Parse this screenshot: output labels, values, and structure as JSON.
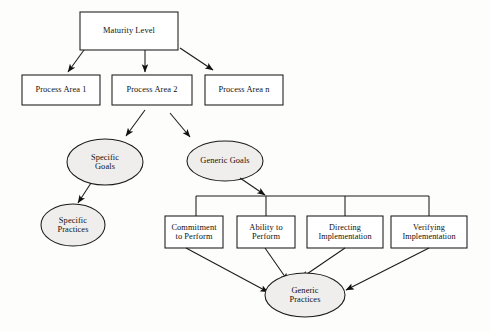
{
  "diagram": {
    "style": {
      "stroke": "#1a1a1a",
      "box_fill": "#ffffff",
      "ellipse_fill": "#f0eeec",
      "background": "#fdfdfb",
      "text_color": "#111111"
    },
    "nodes": [
      {
        "id": "maturity-level",
        "shape": "rect",
        "label": "Maturity Level",
        "x": 80,
        "y": 12,
        "w": 98,
        "h": 38
      },
      {
        "id": "process-area-1",
        "shape": "rect",
        "label": "Process Area 1",
        "x": 22,
        "y": 75,
        "w": 78,
        "h": 30
      },
      {
        "id": "process-area-2",
        "shape": "rect",
        "label": "Process Area 2",
        "x": 112,
        "y": 75,
        "w": 80,
        "h": 30
      },
      {
        "id": "process-area-n",
        "shape": "rect",
        "label": "Process Area n",
        "x": 205,
        "y": 75,
        "w": 78,
        "h": 30
      },
      {
        "id": "specific-goals",
        "shape": "ellipse",
        "label": "Specific\nGoals",
        "cx": 105,
        "cy": 162,
        "rx": 38,
        "ry": 23
      },
      {
        "id": "generic-goals",
        "shape": "ellipse",
        "label": "Generic Goals",
        "cx": 225,
        "cy": 161,
        "rx": 38,
        "ry": 20
      },
      {
        "id": "specific-practices",
        "shape": "ellipse",
        "label": "Specific\nPractices",
        "cx": 73,
        "cy": 225,
        "rx": 32,
        "ry": 21
      },
      {
        "id": "commitment-to-perform",
        "shape": "rect",
        "label": "Commitment\nto Perform",
        "x": 165,
        "y": 216,
        "w": 58,
        "h": 32
      },
      {
        "id": "ability-to-perform",
        "shape": "rect",
        "label": "Ability  to\nPerform",
        "x": 237,
        "y": 216,
        "w": 58,
        "h": 32
      },
      {
        "id": "directing-implementation",
        "shape": "rect",
        "label": "Directing\nImplementation",
        "x": 307,
        "y": 216,
        "w": 76,
        "h": 32
      },
      {
        "id": "verifying-implementation",
        "shape": "rect",
        "label": "Verifying\nImplementation",
        "x": 391,
        "y": 216,
        "w": 76,
        "h": 32
      }
    ],
    "edges": [
      {
        "id": "edge-ml-pa1",
        "from": "maturity-level",
        "to": "process-area-1",
        "kind": "arrow"
      },
      {
        "id": "edge-ml-pa2",
        "from": "maturity-level",
        "to": "process-area-2",
        "kind": "arrow"
      },
      {
        "id": "edge-ml-pan",
        "from": "maturity-level",
        "to": "process-area-n",
        "kind": "arrow"
      },
      {
        "id": "edge-pa2-sg",
        "from": "process-area-2",
        "to": "specific-goals",
        "kind": "arrow"
      },
      {
        "id": "edge-pa2-gg",
        "from": "process-area-2",
        "to": "generic-goals",
        "kind": "arrow"
      },
      {
        "id": "edge-sg-sp",
        "from": "specific-goals",
        "to": "specific-practices",
        "kind": "arrow"
      },
      {
        "id": "edge-gg-bus",
        "from": "generic-goals",
        "to": "common-features-bus",
        "kind": "arrow"
      },
      {
        "id": "edge-bus-commitment",
        "from": "common-features-bus",
        "to": "commitment-to-perform",
        "kind": "line"
      },
      {
        "id": "edge-bus-ability",
        "from": "common-features-bus",
        "to": "ability-to-perform",
        "kind": "line"
      },
      {
        "id": "edge-bus-directing",
        "from": "common-features-bus",
        "to": "directing-implementation",
        "kind": "line"
      },
      {
        "id": "edge-bus-verifying",
        "from": "common-features-bus",
        "to": "verifying-implementation",
        "kind": "line"
      },
      {
        "id": "edge-commitment-gp",
        "from": "commitment-to-perform",
        "to": "generic-practices",
        "kind": "arrow"
      },
      {
        "id": "edge-ability-gp",
        "from": "ability-to-perform",
        "to": "generic-practices",
        "kind": "arrow"
      },
      {
        "id": "edge-directing-gp",
        "from": "directing-implementation",
        "to": "generic-practices",
        "kind": "arrow"
      },
      {
        "id": "edge-verifying-gp",
        "from": "verifying-implementation",
        "to": "generic-practices",
        "kind": "arrow"
      }
    ],
    "generic_practices": {
      "id": "generic-practices",
      "shape": "ellipse",
      "label": "Generic\nPractices",
      "cx": 305,
      "cy": 295,
      "rx": 40,
      "ry": 22
    }
  }
}
